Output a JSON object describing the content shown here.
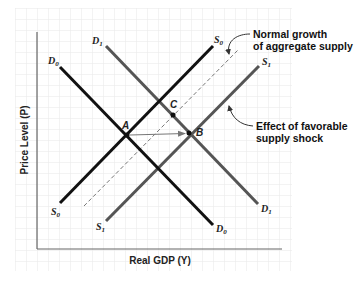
{
  "diagram": {
    "title": "",
    "axes": {
      "x_label": "Real GDP (Y)",
      "y_label": "Price Level (P)"
    },
    "curves": [
      {
        "id": "S0",
        "label_main": "S",
        "label_sub": "0",
        "label_top": "S",
        "label_top_sub": "0",
        "type": "aggregate-supply",
        "style": "solid",
        "color": "#111111"
      },
      {
        "id": "S1",
        "label_main": "S",
        "label_sub": "1",
        "label_top": "S",
        "label_top_sub": "1",
        "type": "aggregate-supply",
        "style": "solid",
        "color": "#555555"
      },
      {
        "id": "D0",
        "label_main": "D",
        "label_sub": "0",
        "label_top": "D",
        "label_top_sub": "0",
        "type": "aggregate-demand",
        "style": "solid",
        "color": "#111111"
      },
      {
        "id": "D1",
        "label_main": "D",
        "label_sub": "1",
        "label_top": "D",
        "label_top_sub": "1",
        "type": "aggregate-demand",
        "style": "solid",
        "color": "#555555"
      },
      {
        "id": "normal-growth",
        "type": "aggregate-supply-normal-growth",
        "style": "dashed",
        "color": "#777777"
      }
    ],
    "points": [
      {
        "id": "A",
        "label": "A"
      },
      {
        "id": "B",
        "label": "B"
      },
      {
        "id": "C",
        "label": "C"
      }
    ],
    "annotations": {
      "normal_growth": {
        "line1": "Normal growth",
        "line2": "of aggregate supply"
      },
      "favorable_shock": {
        "line1": "Effect of favorable",
        "line2": "supply shock"
      }
    },
    "colors": {
      "grid": "#e6e6e6",
      "axis": "#666666",
      "dark_line": "#111111",
      "gray_line": "#555555",
      "dashed_line": "#777777",
      "arrow": "#777777"
    }
  }
}
